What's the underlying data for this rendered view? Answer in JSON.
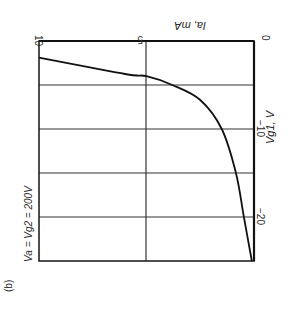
{
  "figure_label": "(b)",
  "condition": "Va = Vg2 = 200V",
  "chart_data": {
    "type": "line",
    "title": "",
    "orientation": "rotated 90° (printed sideways)",
    "xlabel": "Vg1, V",
    "ylabel": "Ia, mA",
    "x_ticks": [
      "0",
      "-10",
      "-20"
    ],
    "y_ticks": [
      "0",
      "5",
      "10"
    ],
    "xlim": [
      -25,
      0
    ],
    "ylim": [
      0,
      10
    ],
    "grid": true,
    "legend": null,
    "annotations": [
      "Va = Vg2 = 200V",
      "(b)"
    ],
    "series": [
      {
        "name": "Ia vs Vg1",
        "x": [
          -1.9,
          -3.75,
          -4.0,
          -5.0,
          -6.7,
          -10.0,
          -15.0,
          -20.0,
          -25.0
        ],
        "y": [
          10.0,
          6.0,
          5.0,
          3.8,
          2.5,
          1.5,
          0.84,
          0.47,
          0.1
        ]
      }
    ]
  },
  "labels": {
    "ia_unit": "Ia, mA",
    "vg1_unit": "Vg1, V",
    "tick_0_v": "0",
    "tick_m10": "−10",
    "tick_m20": "−20",
    "tick_0_ma": "0",
    "tick_5": "5",
    "tick_10": "10"
  }
}
